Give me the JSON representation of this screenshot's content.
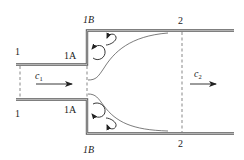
{
  "figure": {
    "sections": {
      "s1_top": "1",
      "s1_bottom": "1",
      "s1A_top": "1A",
      "s1A_bottom": "1A",
      "s1B_top": "1B",
      "s1B_bottom": "1B",
      "s2_top": "2",
      "s2_bottom": "2"
    },
    "velocities": {
      "inlet": {
        "symbol": "c",
        "subscript": "1"
      },
      "outlet": {
        "symbol": "c",
        "subscript": "2"
      }
    },
    "colors": {
      "wall": "#555555",
      "line": "#222222",
      "background": "#ffffff"
    }
  }
}
